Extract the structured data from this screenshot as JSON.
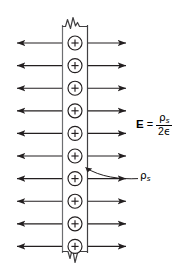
{
  "figure": {
    "type": "physics-diagram",
    "width": 182,
    "height": 277,
    "background_color": "#ffffff",
    "line_color": "#231f20",
    "slab": {
      "name": "charged-slab",
      "left_x": 62,
      "right_x": 88,
      "top_y": 18,
      "bottom_y": 262,
      "fill_color": "#ffffff",
      "stroke_color": "#58595b",
      "break_symbol": "zigzag",
      "break_top": true,
      "break_bottom": true
    },
    "charges": {
      "name": "positive-charge",
      "symbol": "+",
      "count": 10,
      "radius": 7,
      "center_x": 75,
      "first_center_y": 43,
      "spacing_y": 22.6,
      "stroke_color": "#231f20"
    },
    "field_arrows": {
      "name": "electric-field-arrow",
      "count_per_side": 10,
      "left_tip_x": 10,
      "left_tail_x": 62,
      "right_tail_x": 88,
      "right_tip_x": 133,
      "first_y": 43,
      "spacing_y": 22.6,
      "color": "#231f20",
      "left_direction": "left",
      "right_direction": "right"
    },
    "leader": {
      "name": "rho-s-leader-line",
      "from_x": 86,
      "from_y": 167,
      "to_x": 137,
      "to_y": 178,
      "style": "curved"
    }
  },
  "labels": {
    "equation": {
      "lhs": "E",
      "equals": "=",
      "numerator": "ρ",
      "numerator_sub": "s",
      "denominator_coefficient": "2",
      "denominator_symbol": "ϵ",
      "full_text": "E = ρs / 2ϵ"
    },
    "charge_density": {
      "symbol": "ρ",
      "subscript": "s",
      "full_text": "ρs"
    }
  }
}
